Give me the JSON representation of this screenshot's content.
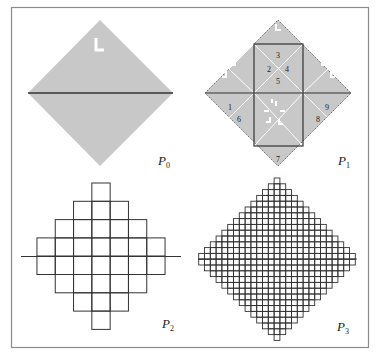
{
  "figure": {
    "frame_color": "#8a8a8a",
    "diamond_fill": "#c8c8c8",
    "line_color": "#333333",
    "white_mark_color": "#ffffff",
    "panels": [
      {
        "id": "P0",
        "label": "P",
        "subscript": "0",
        "description": "Shaded square rotated 45 degrees with a horizontal diagonal and an L mark at the top"
      },
      {
        "id": "P1",
        "label": "P",
        "subscript": "1",
        "description": "Shaded diamond subdivided into triangles with inner square and numbered regions",
        "region_numbers": [
          "1",
          "2",
          "3",
          "4",
          "5",
          "6",
          "7",
          "8",
          "9"
        ]
      },
      {
        "id": "P2",
        "label": "P",
        "subscript": "2",
        "description": "Stepped diamond of unit squares with horizontal axis",
        "row_widths": [
          1,
          3,
          5,
          7,
          7,
          5,
          3,
          1
        ]
      },
      {
        "id": "P3",
        "label": "P",
        "subscript": "3",
        "description": "Fine stepped diamond grid with horizontal axis"
      }
    ]
  }
}
